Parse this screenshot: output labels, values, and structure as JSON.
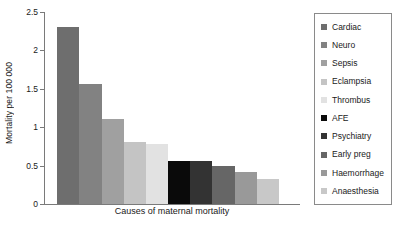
{
  "chart_data": {
    "type": "bar",
    "title": "",
    "xlabel": "Causes of maternal mortality",
    "ylabel": "Mortality per 100 000",
    "categories": [
      "Cardiac",
      "Neuro",
      "Sepsis",
      "Eclampsia",
      "Thrombus",
      "AFE",
      "Psychiatry",
      "Early preg",
      "Haemorrhage",
      "Anaesthesia"
    ],
    "values": [
      2.3,
      1.56,
      1.11,
      0.81,
      0.78,
      0.56,
      0.56,
      0.49,
      0.42,
      0.32
    ],
    "colors": [
      "#6e6e6e",
      "#828282",
      "#a0a0a0",
      "#c4c4c4",
      "#e2e2e2",
      "#0a0a0a",
      "#333333",
      "#666666",
      "#999999",
      "#c8c8c8"
    ],
    "ylim": [
      0,
      2.5
    ],
    "yticks": [
      0,
      0.5,
      1,
      1.5,
      2,
      2.5
    ],
    "ytick_labels": [
      "0",
      "0.5",
      "1",
      "1.5",
      "2",
      "2.5"
    ],
    "grid": false,
    "legend_position": "right"
  },
  "legend": {
    "entries": [
      {
        "label": "Cardiac",
        "color": "#6e6e6e"
      },
      {
        "label": "Neuro",
        "color": "#828282"
      },
      {
        "label": "Sepsis",
        "color": "#a0a0a0"
      },
      {
        "label": "Eclampsia",
        "color": "#c4c4c4"
      },
      {
        "label": "Thrombus",
        "color": "#e2e2e2"
      },
      {
        "label": "AFE",
        "color": "#0a0a0a"
      },
      {
        "label": "Psychiatry",
        "color": "#333333"
      },
      {
        "label": "Early preg",
        "color": "#666666"
      },
      {
        "label": "Haemorrhage",
        "color": "#999999"
      },
      {
        "label": "Anaesthesia",
        "color": "#c8c8c8"
      }
    ]
  }
}
